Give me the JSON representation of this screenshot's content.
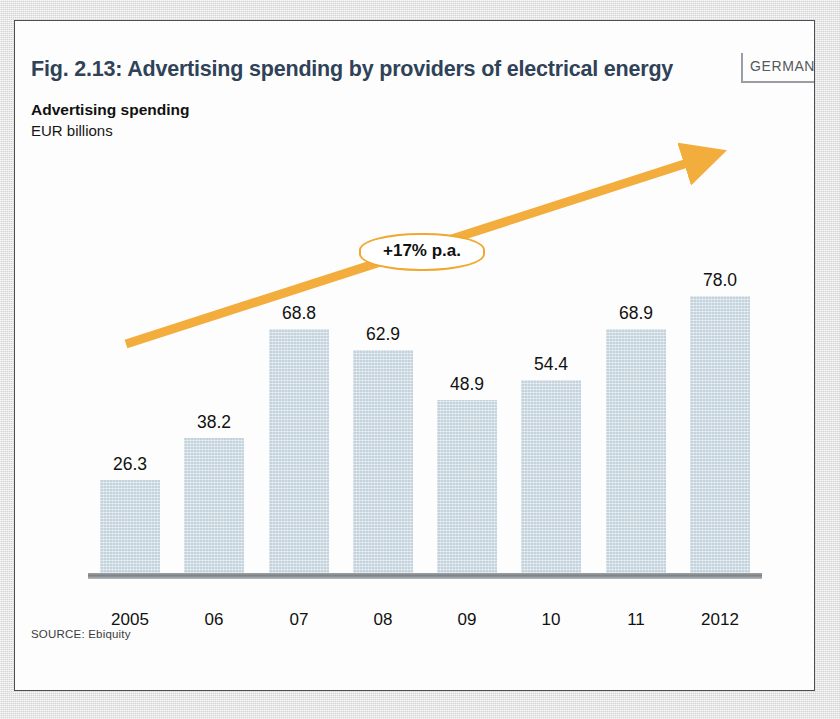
{
  "header": {
    "title": "Fig. 2.13: Advertising spending by providers of electrical energy",
    "region_badge": "GERMANY"
  },
  "axis_labels": {
    "measure_title": "Advertising spending",
    "measure_units": "EUR billions"
  },
  "annotation": {
    "growth_label": "+17% p.a."
  },
  "footer": {
    "source": "SOURCE: Ebiquity"
  },
  "colors": {
    "title": "#2f4257",
    "bar_fill": "#d2dfe7",
    "arrow": "#f3ad3d",
    "axis_line": "#7d8287",
    "card_background": "#fdfdfd",
    "page_background": "#dcdcdc"
  },
  "chart_data": {
    "type": "bar",
    "title": "Fig. 2.13: Advertising spending by providers of electrical energy",
    "subtitle": "Advertising spending",
    "xlabel": "",
    "ylabel": "EUR billions",
    "categories": [
      "2005",
      "06",
      "07",
      "08",
      "09",
      "10",
      "11",
      "2012"
    ],
    "values": [
      26.3,
      38.2,
      68.8,
      62.9,
      48.9,
      54.4,
      68.9,
      78.0
    ],
    "value_labels": [
      "26.3",
      "38.2",
      "68.8",
      "62.9",
      "48.9",
      "54.4",
      "68.9",
      "78.0"
    ],
    "ylim": [
      0,
      78
    ],
    "grid": false,
    "legend": null,
    "annotations": [
      {
        "text": "+17% p.a.",
        "type": "trend-arrow-callout",
        "direction": "up-right"
      }
    ],
    "source": "SOURCE: Ebiquity",
    "region": "GERMANY"
  }
}
